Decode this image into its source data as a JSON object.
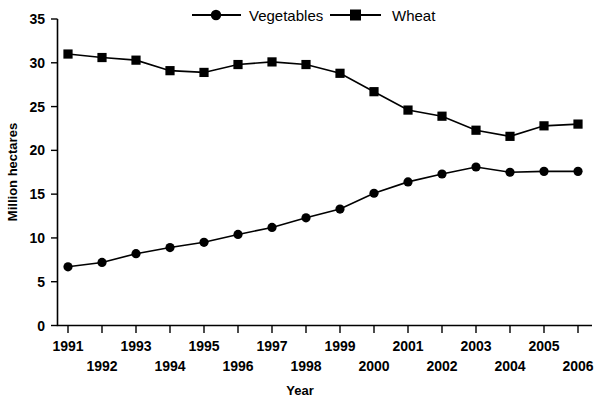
{
  "chart_data": {
    "type": "line",
    "title": "",
    "xlabel": "Year",
    "ylabel": "Million hectares",
    "x": [
      1991,
      1992,
      1993,
      1994,
      1995,
      1996,
      1997,
      1998,
      1999,
      2000,
      2001,
      2002,
      2003,
      2004,
      2005,
      2006
    ],
    "categories": [
      "1991",
      "1992",
      "1993",
      "1994",
      "1995",
      "1996",
      "1997",
      "1998",
      "1999",
      "2000",
      "2001",
      "2002",
      "2003",
      "2004",
      "2005",
      "2006"
    ],
    "series": [
      {
        "name": "Vegetables",
        "marker": "circle",
        "color": "#000000",
        "values": [
          6.7,
          7.2,
          8.2,
          8.9,
          9.5,
          10.4,
          11.2,
          12.3,
          13.3,
          15.1,
          16.4,
          17.3,
          18.1,
          17.5,
          17.6,
          17.6
        ]
      },
      {
        "name": "Wheat",
        "marker": "square",
        "color": "#000000",
        "values": [
          31.0,
          30.6,
          30.3,
          29.1,
          28.9,
          29.8,
          30.1,
          29.8,
          28.8,
          26.7,
          24.6,
          23.9,
          22.3,
          21.6,
          22.8,
          23.0
        ]
      }
    ],
    "ylim": [
      0,
      35
    ],
    "yticks": [
      0,
      5,
      10,
      15,
      20,
      25,
      30,
      35
    ],
    "ytick_labels": [
      "0",
      "5",
      "10",
      "15",
      "20",
      "25",
      "30",
      "35"
    ],
    "xlim": [
      1991,
      2006
    ],
    "xtick_labels_row_top": [
      "1991",
      "1993",
      "1995",
      "1997",
      "1999",
      "2001",
      "2003",
      "2005"
    ],
    "xtick_labels_row_bottom": [
      "1992",
      "1994",
      "1996",
      "1998",
      "2000",
      "2002",
      "2004",
      "2006"
    ],
    "grid": false,
    "legend_position": "top-center",
    "legend_entries": [
      "Vegetables",
      "Wheat"
    ]
  },
  "legend": {
    "items": [
      {
        "label": "Vegetables",
        "marker": "circle-marker"
      },
      {
        "label": "Wheat",
        "marker": "square-marker"
      }
    ]
  },
  "axes": {
    "y_title": "Million hectares",
    "x_title": "Year"
  }
}
